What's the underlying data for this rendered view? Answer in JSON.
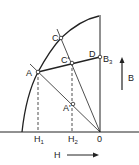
{
  "diagram": {
    "points": {
      "O": {
        "label": "O",
        "x": 100,
        "y": 132
      },
      "A": {
        "label": "A",
        "x": 38,
        "y": 72
      },
      "C": {
        "label": "C",
        "x": 61,
        "y": 38
      },
      "C_prime": {
        "label": "C'",
        "x": 72,
        "y": 63
      },
      "D": {
        "label": "D",
        "x": 100,
        "y": 57
      },
      "A_prime": {
        "label": "A'",
        "x": 73,
        "y": 104
      }
    },
    "labels": {
      "A": "A",
      "C": "C",
      "C_prime": "C'",
      "D": "D",
      "B3_main": "B",
      "B3_sub": "3",
      "A_prime": "A'",
      "H1_main": "H",
      "H1_sub": "1",
      "H2_main": "H",
      "H2_sub": "2",
      "O": "0",
      "H_axis": "H",
      "B_axis": "B"
    },
    "colors": {
      "line": "#222222",
      "background": "#ffffff"
    }
  }
}
